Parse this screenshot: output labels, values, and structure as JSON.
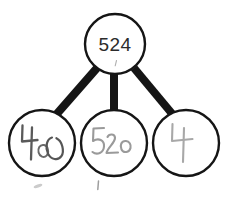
{
  "diagram": {
    "type": "number-bond",
    "background_color": "#ffffff",
    "stroke_color": "#151515",
    "parent": {
      "label": "524",
      "value": "524",
      "style": "printed",
      "text_color": "#2b2b2b",
      "cx": 115,
      "cy": 44,
      "r": 30
    },
    "children": [
      {
        "name": "left",
        "label": "400",
        "value": "400",
        "style": "handwritten",
        "ink_color": "#5f5f5f",
        "cx": 42,
        "cy": 143,
        "r": 33
      },
      {
        "name": "middle",
        "label": "520",
        "value": "520",
        "style": "handwritten",
        "ink_color": "#9a9a9a",
        "cx": 114,
        "cy": 143,
        "r": 33
      },
      {
        "name": "right",
        "label": "4",
        "value": "4",
        "style": "handwritten",
        "ink_color": "#a5a5a5",
        "cx": 186,
        "cy": 143,
        "r": 33
      }
    ],
    "branches": [
      {
        "name": "left-branch",
        "from": "parent",
        "to": "left"
      },
      {
        "name": "middle-branch",
        "from": "parent",
        "to": "middle"
      },
      {
        "name": "right-branch",
        "from": "parent",
        "to": "right"
      }
    ],
    "stray_marks": [
      {
        "name": "tick-below-parent"
      },
      {
        "name": "smudge-below-left"
      },
      {
        "name": "smudge-below-middle"
      }
    ]
  }
}
